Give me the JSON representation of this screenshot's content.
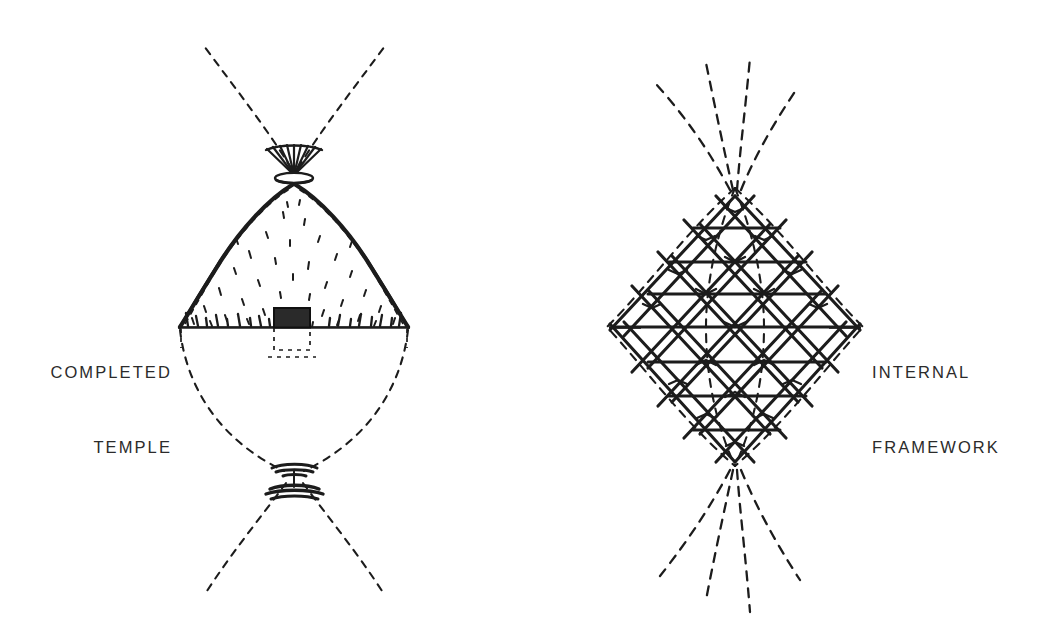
{
  "figure": {
    "kind": "architectural-diagram",
    "background_color": "#ffffff",
    "ink_color": "#1c1c1c",
    "panels": [
      {
        "id": "completed-temple",
        "label_lines": [
          "COMPLETED",
          "TEMPLE"
        ],
        "label_side": "left",
        "leader_dash": "—",
        "elements": [
          "vesica-upper-arcs",
          "crown-finial",
          "thatched-dome",
          "ground-line",
          "doorway",
          "foundation-outline",
          "vesica-lower-arcs",
          "lower-node-finial"
        ]
      },
      {
        "id": "internal-framework",
        "label_lines": [
          "INTERNAL",
          "FRAMEWORK"
        ],
        "label_side": "right",
        "leader_dash": "—",
        "elements": [
          "vesica-upper-arcs",
          "diamond-lattice",
          "equator-tick-left",
          "equator-tick-right",
          "vesica-lower-arcs"
        ]
      }
    ]
  },
  "labels": {
    "completed_temple_line1": "COMPLETED",
    "completed_temple_line2": "TEMPLE",
    "internal_framework_line1": "INTERNAL",
    "internal_framework_line2": "FRAMEWORK"
  },
  "geometry": {
    "left_panel": {
      "center_x": 294,
      "top_node_y": 170,
      "ground_y": 327,
      "bottom_node_y": 477,
      "dome_half_width": 116,
      "doorway": {
        "x": 274,
        "y": 309,
        "width": 36,
        "height": 19
      },
      "ground_line_x1": 178,
      "ground_line_x2": 410
    },
    "right_panel": {
      "center_x": 735,
      "top_node_y": 186,
      "equator_y": 327,
      "bottom_node_y": 468,
      "lattice_half_width": 128,
      "tick_left_x1": 609,
      "tick_left_x2": 641,
      "tick_right_x1": 829,
      "tick_right_x2": 861
    }
  }
}
